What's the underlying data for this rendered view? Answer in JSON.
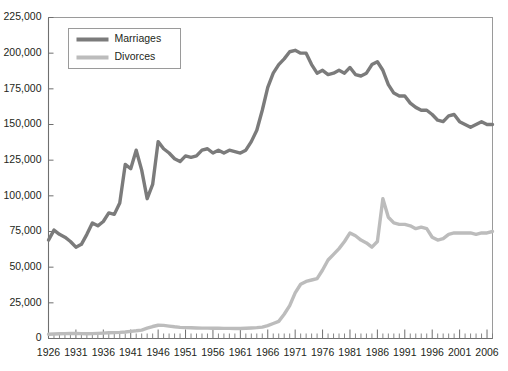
{
  "chart_data": {
    "type": "line",
    "title": "",
    "subtitle": "",
    "xlabel": "",
    "ylabel": "",
    "xlim": [
      1926,
      2007
    ],
    "ylim": [
      0,
      225000
    ],
    "grid": false,
    "legend_position": "top-left",
    "y_ticks": [
      0,
      25000,
      50000,
      75000,
      100000,
      125000,
      150000,
      175000,
      200000,
      225000
    ],
    "y_tick_labels": [
      "0",
      "25,000",
      "50,000",
      "75,000",
      "100,000",
      "125,000",
      "150,000",
      "175,000",
      "200,000",
      "225,000"
    ],
    "x_ticks": [
      1926,
      1931,
      1936,
      1941,
      1946,
      1951,
      1956,
      1961,
      1966,
      1971,
      1976,
      1981,
      1986,
      1991,
      1996,
      2001,
      2006
    ],
    "x_tick_labels": [
      "1926",
      "1931",
      "1936",
      "1941",
      "1946",
      "1951",
      "1956",
      "1961",
      "1966",
      "1971",
      "1976",
      "1981",
      "1986",
      "1991",
      "1996",
      "2001",
      "2006"
    ],
    "x_minor_tick_step": 1,
    "x": [
      1926,
      1927,
      1928,
      1929,
      1930,
      1931,
      1932,
      1933,
      1934,
      1935,
      1936,
      1937,
      1938,
      1939,
      1940,
      1941,
      1942,
      1943,
      1944,
      1945,
      1946,
      1947,
      1948,
      1949,
      1950,
      1951,
      1952,
      1953,
      1954,
      1955,
      1956,
      1957,
      1958,
      1959,
      1960,
      1961,
      1962,
      1963,
      1964,
      1965,
      1966,
      1967,
      1968,
      1969,
      1970,
      1971,
      1972,
      1973,
      1974,
      1975,
      1976,
      1977,
      1978,
      1979,
      1980,
      1981,
      1982,
      1983,
      1984,
      1985,
      1986,
      1987,
      1988,
      1989,
      1990,
      1991,
      1992,
      1993,
      1994,
      1995,
      1996,
      1997,
      1998,
      1999,
      2000,
      2001,
      2002,
      2003,
      2004,
      2005,
      2006,
      2007
    ],
    "series": [
      {
        "name": "Marriages",
        "color": "#7b7b7b",
        "stroke_width": 3.4,
        "values": [
          69000,
          76000,
          73000,
          71000,
          68000,
          64000,
          66000,
          73000,
          81000,
          79000,
          82000,
          88000,
          87000,
          95000,
          122000,
          119000,
          132000,
          118000,
          98000,
          108000,
          138000,
          133000,
          130000,
          126000,
          124000,
          128000,
          127000,
          128000,
          132000,
          133000,
          130000,
          132000,
          130000,
          132000,
          131000,
          130000,
          132000,
          138000,
          146000,
          160000,
          176000,
          186000,
          192000,
          196000,
          201000,
          202000,
          200000,
          200000,
          192000,
          186000,
          188000,
          185000,
          186000,
          188000,
          186000,
          190000,
          185000,
          184000,
          186000,
          192000,
          194000,
          188000,
          178000,
          172000,
          170000,
          170000,
          165000,
          162000,
          160000,
          160000,
          157000,
          153000,
          152000,
          156000,
          157000,
          152000,
          150000,
          148000,
          150000,
          152000,
          150000,
          150000
        ]
      },
      {
        "name": "Divorces",
        "color": "#bcbcbc",
        "stroke_width": 3.4,
        "values": [
          3000,
          3200,
          3300,
          3400,
          3500,
          3500,
          3400,
          3300,
          3400,
          3600,
          3800,
          4000,
          4100,
          4300,
          4600,
          5000,
          5400,
          5900,
          7200,
          8400,
          9300,
          9200,
          8700,
          8200,
          7800,
          7600,
          7500,
          7400,
          7300,
          7300,
          7200,
          7200,
          7100,
          7100,
          7000,
          7000,
          7200,
          7400,
          7600,
          8000,
          9000,
          10500,
          12000,
          17000,
          23000,
          32000,
          38000,
          40000,
          41000,
          42000,
          48000,
          55000,
          59000,
          63000,
          68000,
          74000,
          72000,
          69000,
          67000,
          64000,
          68000,
          98000,
          85000,
          81000,
          80000,
          80000,
          79000,
          77000,
          78000,
          77000,
          71000,
          69000,
          70000,
          73000,
          74000,
          74000,
          74000,
          74000,
          73000,
          74000,
          74000,
          75000
        ]
      }
    ]
  },
  "legend": {
    "entries": [
      {
        "label": "Marriages",
        "swatch_name": "legend-swatch-marriages"
      },
      {
        "label": "Divorces",
        "swatch_name": "legend-swatch-divorces"
      }
    ]
  },
  "colors": {
    "marriages": "#7b7b7b",
    "divorces": "#bcbcbc",
    "axis": "#6f6f6f",
    "frame": "#9a9a9a",
    "text": "#231f20",
    "background": "#ffffff"
  }
}
